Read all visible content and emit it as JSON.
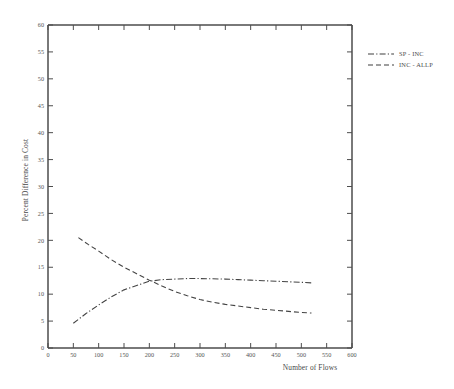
{
  "chart_data": {
    "type": "line",
    "title": "",
    "xlabel": "Number of Flows",
    "ylabel": "Percent Difference in Cost",
    "xlim": [
      0,
      600
    ],
    "ylim": [
      0,
      60
    ],
    "xticks": [
      0,
      50,
      100,
      150,
      200,
      250,
      300,
      350,
      400,
      450,
      500,
      550,
      600
    ],
    "yticks": [
      0,
      5,
      10,
      15,
      20,
      25,
      30,
      35,
      40,
      45,
      50,
      55,
      60
    ],
    "grid": false,
    "legend_position": "top-right-outside",
    "series": [
      {
        "name": "SP - INC",
        "style": "dash-dot",
        "color": "#444444",
        "x": [
          50,
          75,
          100,
          125,
          150,
          175,
          200,
          225,
          250,
          275,
          300,
          325,
          350,
          375,
          400,
          425,
          450,
          475,
          500,
          520
        ],
        "y": [
          4.6,
          6.4,
          8.0,
          9.5,
          10.8,
          11.6,
          12.4,
          12.7,
          12.8,
          12.9,
          12.9,
          12.85,
          12.8,
          12.7,
          12.6,
          12.5,
          12.4,
          12.3,
          12.2,
          12.1
        ]
      },
      {
        "name": "INC - ALLP",
        "style": "dashed",
        "color": "#444444",
        "x": [
          60,
          80,
          100,
          125,
          150,
          175,
          200,
          225,
          250,
          275,
          300,
          325,
          350,
          375,
          400,
          425,
          450,
          475,
          500,
          520
        ],
        "y": [
          20.5,
          19.2,
          18.0,
          16.4,
          15.0,
          13.8,
          12.6,
          11.5,
          10.5,
          9.7,
          9.0,
          8.5,
          8.1,
          7.8,
          7.5,
          7.2,
          7.0,
          6.8,
          6.6,
          6.5
        ]
      }
    ],
    "legend": [
      {
        "label": "SP - INC",
        "style": "dash-dot"
      },
      {
        "label": "INC - ALLP",
        "style": "dashed"
      }
    ]
  },
  "colors": {
    "axis": "#4d4d4d",
    "curve": "#3f3f3f",
    "background": "#ffffff"
  }
}
